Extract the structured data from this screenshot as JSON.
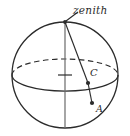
{
  "figure": {
    "background_color": "#ffffff",
    "stroke_color": "#2b2b2b",
    "labels": {
      "zenith": "zenith",
      "center": "C",
      "point": "A"
    },
    "geometry": {
      "sphere": {
        "cx": 65,
        "cy": 75,
        "r": 53
      },
      "equator_ellipse": {
        "cx": 65,
        "cy": 75,
        "rx": 53,
        "ry": 16
      },
      "polar_axis": {
        "x1": 65,
        "y1": 22,
        "x2": 65,
        "y2": 128
      },
      "center_tick": {
        "x1": 58,
        "y1": 75,
        "x2": 72,
        "y2": 75
      },
      "zenith_point": {
        "x": 65,
        "y": 22
      },
      "point_c": {
        "x": 88,
        "y": 83
      },
      "point_a": {
        "x": 92,
        "y": 103
      },
      "leader_line": {
        "x1": 66,
        "y1": 20,
        "x2": 77,
        "y2": 12
      }
    },
    "line_styles": {
      "back_equator": "dashed",
      "front_equator": "solid",
      "outline": "solid"
    }
  }
}
